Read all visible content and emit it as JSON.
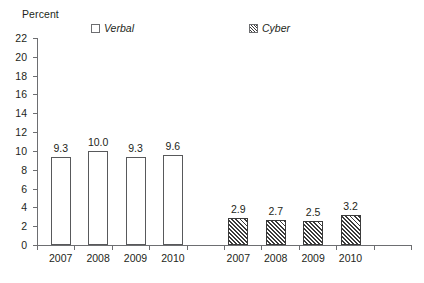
{
  "chart_data": {
    "type": "bar",
    "title": "",
    "ylabel": "Percent",
    "xlabel": "",
    "ylim": [
      0,
      22
    ],
    "ytick_step": 2,
    "yticks": [
      0,
      2,
      4,
      6,
      8,
      10,
      12,
      14,
      16,
      18,
      20,
      22
    ],
    "grid": false,
    "legend_position": "top",
    "categories": [
      "2007",
      "2008",
      "2009",
      "2010"
    ],
    "series": [
      {
        "name": "Verbal",
        "style": "open",
        "values": [
          9.3,
          10.0,
          9.3,
          9.6
        ],
        "labels": [
          "9.3",
          "10.0",
          "9.3",
          "9.6"
        ]
      },
      {
        "name": "Cyber",
        "style": "hatched",
        "values": [
          2.9,
          2.7,
          2.5,
          3.2
        ],
        "labels": [
          "2.9",
          "2.7",
          "2.5",
          "3.2"
        ]
      }
    ]
  },
  "axis": {
    "y_title": "Percent",
    "y_tick_labels": [
      "22",
      "20",
      "18",
      "16",
      "14",
      "12",
      "10",
      "8",
      "6",
      "4",
      "2",
      "0"
    ],
    "x_group_labels_verbal": [
      "2007",
      "2008",
      "2009",
      "2010"
    ],
    "x_group_labels_cyber": [
      "2007",
      "2008",
      "2009",
      "2010"
    ]
  },
  "legend": {
    "verbal_label": "Verbal",
    "cyber_label": "Cyber"
  },
  "colors": {
    "axis": "#6d6e71",
    "bar_outline": "#58595b",
    "hatch": "#3b3b3b",
    "text": "#231f20",
    "background": "#ffffff"
  }
}
